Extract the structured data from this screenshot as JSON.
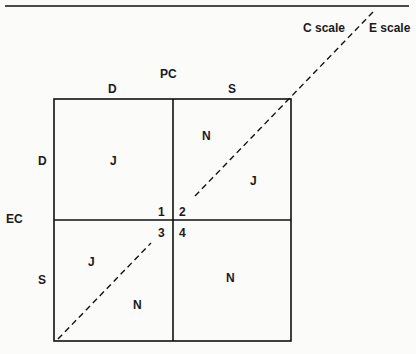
{
  "diagram": {
    "type": "quadrant-matrix",
    "top_axis": {
      "title": "PC",
      "left": "D",
      "right": "S"
    },
    "left_axis": {
      "title": "EC",
      "top": "D",
      "bottom": "S"
    },
    "scale_labels": {
      "c_scale": "C scale",
      "e_scale": "E scale"
    },
    "quadrants": [
      {
        "id": "1",
        "number": "1",
        "label": "J",
        "position": "top-left"
      },
      {
        "id": "2",
        "number": "2",
        "labels": [
          "N",
          "J"
        ],
        "position": "top-right"
      },
      {
        "id": "3",
        "number": "3",
        "labels": [
          "J",
          "N"
        ],
        "position": "bottom-left"
      },
      {
        "id": "4",
        "number": "4",
        "label": "N",
        "position": "bottom-right"
      }
    ]
  }
}
